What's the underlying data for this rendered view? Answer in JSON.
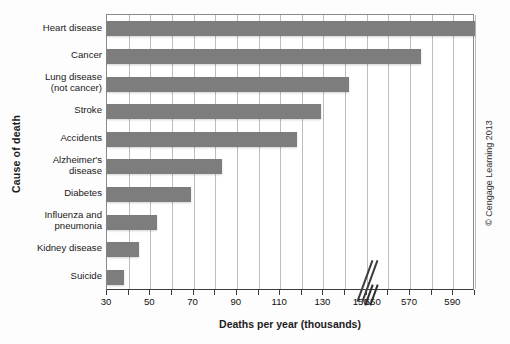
{
  "chart_data": {
    "type": "bar",
    "orientation": "horizontal",
    "title": "",
    "xlabel": "Deaths per year (thousands)",
    "ylabel": "Cause of death",
    "categories": [
      "Suicide",
      "Kidney disease",
      "Influenza and pneumonia",
      "Diabetes",
      "Alzheimer's disease",
      "Accidents",
      "Stroke",
      "Lung disease (not cancer)",
      "Cancer",
      "Heart disease"
    ],
    "category_lines": [
      [
        "Suicide"
      ],
      [
        "Kidney disease"
      ],
      [
        "Influenza and",
        "pneumonia"
      ],
      [
        "Diabetes"
      ],
      [
        "Alzheimer's",
        "disease"
      ],
      [
        "Accidents"
      ],
      [
        "Stroke"
      ],
      [
        "Lung disease",
        "(not cancer)"
      ],
      [
        "Cancer"
      ],
      [
        "Heart disease"
      ]
    ],
    "values": [
      38,
      45,
      53,
      69,
      83,
      118,
      129,
      142,
      575,
      600
    ],
    "xlim": [
      30,
      600
    ],
    "axis_break": {
      "from": 150,
      "to": 550,
      "label_left": "150",
      "label_right": "550"
    },
    "tick_labels": [
      "30",
      "50",
      "70",
      "90",
      "110",
      "130",
      "150",
      "550",
      "570",
      "590"
    ],
    "tick_values": [
      30,
      50,
      70,
      90,
      110,
      130,
      150,
      550,
      570,
      590
    ],
    "minor_tick_values": [
      40,
      60,
      80,
      100,
      120,
      140,
      560,
      580,
      600
    ],
    "grid": true,
    "grid_axis": "x",
    "bar_color": "#7d7d7d",
    "grid_color": "#bdbdbd",
    "axis_color": "#3a3a3a",
    "legend": null
  },
  "credit": {
    "text": "© Cengage Learning 2013"
  }
}
